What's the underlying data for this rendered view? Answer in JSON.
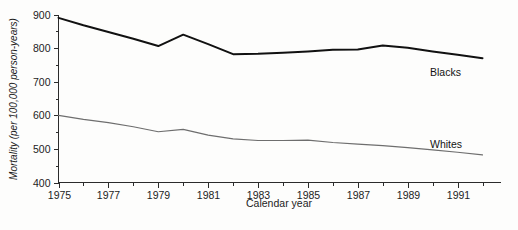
{
  "chart_data": {
    "type": "line",
    "title": "",
    "subtitle": "",
    "xlabel": "Calendar year",
    "ylabel": "Mortality (per 100,000 person-years)",
    "xlim": [
      1975,
      1992
    ],
    "ylim": [
      400,
      900
    ],
    "grid": false,
    "legend_position": "inline-right-of-line-end",
    "x_major_ticks": [
      1975,
      1977,
      1979,
      1981,
      1983,
      1985,
      1987,
      1989,
      1991
    ],
    "x_minor_ticks": [
      1976,
      1978,
      1980,
      1982,
      1984,
      1986,
      1988,
      1990,
      1992
    ],
    "x_tick_labels": [
      "1975",
      "1977",
      "1979",
      "1981",
      "1983",
      "1985",
      "1987",
      "1989",
      "1991"
    ],
    "y_major_ticks": [
      400,
      500,
      600,
      700,
      800,
      900
    ],
    "y_minor_ticks": [
      450,
      550,
      650,
      750,
      850
    ],
    "y_tick_labels": [
      "400",
      "500",
      "600",
      "700",
      "800",
      "900"
    ],
    "x": [
      1975,
      1976,
      1977,
      1978,
      1979,
      1980,
      1981,
      1982,
      1983,
      1984,
      1985,
      1986,
      1987,
      1988,
      1989,
      1990,
      1991,
      1992
    ],
    "series": [
      {
        "name": "Blacks",
        "color": "#111111",
        "line_width": 2.0,
        "label": "Blacks",
        "values": [
          890,
          868,
          848,
          828,
          806,
          840,
          812,
          782,
          783,
          786,
          790,
          795,
          796,
          808,
          801,
          790,
          780,
          770
        ]
      },
      {
        "name": "Whites",
        "color": "#6e6e6e",
        "line_width": 1.2,
        "label": "Whites",
        "values": [
          600,
          588,
          578,
          566,
          551,
          558,
          541,
          530,
          525,
          525,
          526,
          519,
          514,
          510,
          504,
          497,
          490,
          482
        ]
      }
    ]
  },
  "labels": {
    "series_blacks": "Blacks",
    "series_whites": "Whites",
    "x_axis_title": "Calendar year",
    "y_axis_title": "Mortality (per 100,000 person-years)"
  }
}
